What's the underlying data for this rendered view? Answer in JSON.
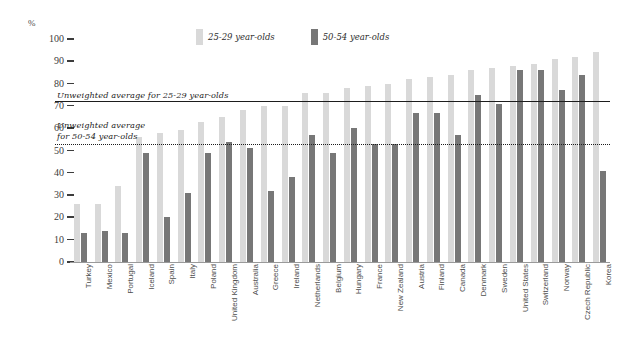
{
  "chart_data": {
    "type": "bar",
    "title": "",
    "subtitle": "",
    "xlabel": "",
    "ylabel": "%",
    "ylim": [
      0,
      100
    ],
    "yticks": [
      100,
      90,
      80,
      70,
      60,
      50,
      40,
      30,
      20,
      10,
      0
    ],
    "grid": false,
    "legend_position": "top-center",
    "categories": [
      "Turkey",
      "Mexico",
      "Portugal",
      "Iceland",
      "Spain",
      "Italy",
      "Poland",
      "United Kingdom",
      "Australia",
      "Greece",
      "Ireland",
      "Netherlands",
      "Belgium",
      "Hungary",
      "France",
      "New Zealand",
      "Austria",
      "Finland",
      "Canada",
      "Denmark",
      "Sweden",
      "United States",
      "Switzerland",
      "Norway",
      "Czech Republic",
      "Korea"
    ],
    "series": [
      {
        "name": "25-29 year-olds",
        "color": "#d9d9d9",
        "values": [
          26,
          26,
          34,
          56,
          58,
          59,
          63,
          65,
          68,
          70,
          70,
          76,
          76,
          78,
          79,
          80,
          82,
          83,
          84,
          86,
          87,
          88,
          89,
          91,
          92,
          94
        ]
      },
      {
        "name": "50-54 year-olds",
        "color": "#777777",
        "values": [
          13,
          14,
          13,
          49,
          20,
          31,
          49,
          54,
          51,
          32,
          38,
          57,
          49,
          60,
          53,
          53,
          67,
          67,
          57,
          75,
          71,
          86,
          86,
          77,
          84,
          41
        ]
      }
    ],
    "reference_lines": [
      {
        "label": "Unweighted average for 25-29 year-olds",
        "value": 72,
        "style": "solid"
      },
      {
        "label": "Unweighted average\nfor 50-54 year-olds",
        "value": 53,
        "style": "dotted"
      }
    ],
    "annotations": {
      "avg_2529_line1": "Unweighted average for 25-29 year-olds",
      "avg_5054_line1": "Unweighted average",
      "avg_5054_line2": "for 50-54 year-olds"
    }
  },
  "axis": {
    "y_unit_label": "%"
  },
  "legend": {
    "items": [
      {
        "label": "25-29 year-olds",
        "swatch": "light"
      },
      {
        "label": "50-54 year-olds",
        "swatch": "dark"
      }
    ]
  },
  "colors": {
    "series_light": "#d9d9d9",
    "series_dark": "#777777",
    "reference_line": "#1d1d1d",
    "axis": "#9a9a9a",
    "text": "#3a3a3a",
    "background": "#ffffff"
  }
}
